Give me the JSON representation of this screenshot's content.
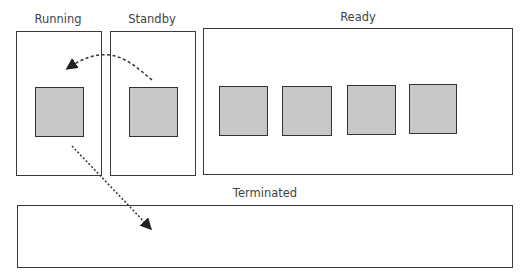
{
  "diagram": {
    "states": {
      "running": {
        "label": "Running",
        "process_count": 1
      },
      "standby": {
        "label": "Standby",
        "process_count": 1
      },
      "ready": {
        "label": "Ready",
        "process_count": 4
      },
      "terminated": {
        "label": "Terminated",
        "process_count": 0
      }
    },
    "transitions": [
      {
        "from": "Standby",
        "to": "Running",
        "style": "dashed-curved-arrow"
      },
      {
        "from": "Running",
        "to": "Terminated",
        "style": "dotted-arrow"
      }
    ],
    "colors": {
      "border": "#3a3a3a",
      "process_fill": "#c8c8c8",
      "background": "#ffffff"
    }
  }
}
